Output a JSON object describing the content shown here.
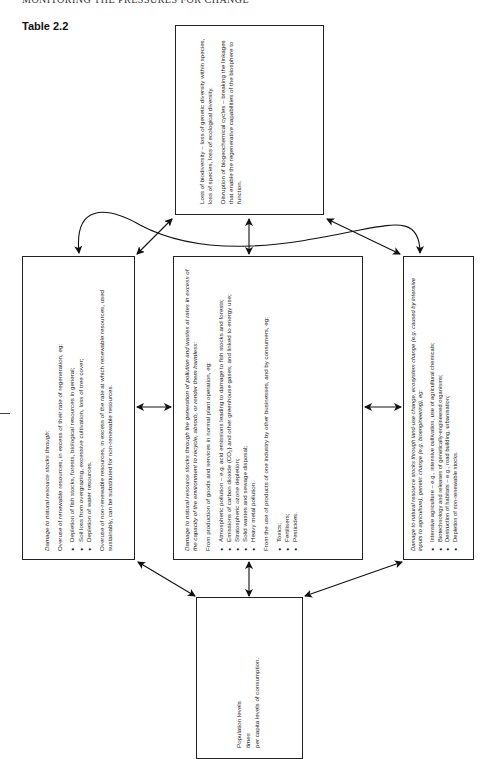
{
  "page": {
    "running_head": "MONITORING THE PRESSURES FOR CHANGE",
    "table_label": "Table 2.2"
  },
  "boxes": {
    "top": {
      "paragraphs": [
        "Loss of biodiversity – loss of genetic diversity within species, loss of species, loss of ecological diversity.",
        "Disruption of biogeochemical cycles – breaking the linkages that enable the regenerative capabilities of the biosphere to function."
      ]
    },
    "left": {
      "lead": "Damage to natural resource stocks through:",
      "intro": "Overuse of renewable resources, in excess of their rate of regeneration, eg:",
      "bullets": [
        "Depletion of fish stocks, forests, biological resources in general;",
        "Soil loss from overgrazing, excessive cultivation, loss of tree cover;",
        "Depletion of water resources."
      ],
      "closing": "Overuse of non-renewable resources, in excess of the rate at which renewable resources, used sustainably, can be substituted for non-renewable resources."
    },
    "center": {
      "lead": "Damage to natural resource stocks through the generation of pollution and wastes at rates in excess of the capacity of the environment to recycle, absorb, or render them harmless:",
      "intro1": "From production of goods and services in normal plant operation, eg:",
      "bullets1": [
        "Atmospheric pollution – e.g. acid emissions leading to damage to fish stocks and forests;",
        "Emissions of carbon dioxide (CO₂) and other greenhouse gases, and linked to energy use;",
        "Stratospheric ozone depletion;",
        "Solid wastes and sewage disposal;",
        "Heavy metal pollution."
      ],
      "intro2": "From the use of products of one industry by other businesses, and by consumers, eg:",
      "bullets2": [
        "Toxics;",
        "Fertilisers;",
        "Pesticides."
      ]
    },
    "right": {
      "lead": "Damage to natural resource stocks through land-use change, ecosystem change (e.g. caused by intensive inputs to agriculture), genetic change (e.g. bioengineering), eg:",
      "bullets": [
        "Intensive agriculture – e.g., intensive cultivation, use of agricultural chemicals;",
        "Biotechnology and releases of genetically-engineered organisms;",
        "Destruction of habitats – e.g., road building, urbanisation;",
        "Depletion of non-renewable stocks."
      ]
    },
    "bottom": {
      "line1": "Population levels",
      "line2": "times",
      "line3": "per capita levels of consumption."
    }
  },
  "connectors": [
    "top↔left (curved)",
    "top↔right (curved)",
    "top↔left (diagonal)",
    "top↔center",
    "top↔right (diagonal)",
    "left↔center",
    "center↔right",
    "left↔bottom",
    "center↔bottom",
    "right↔bottom"
  ]
}
